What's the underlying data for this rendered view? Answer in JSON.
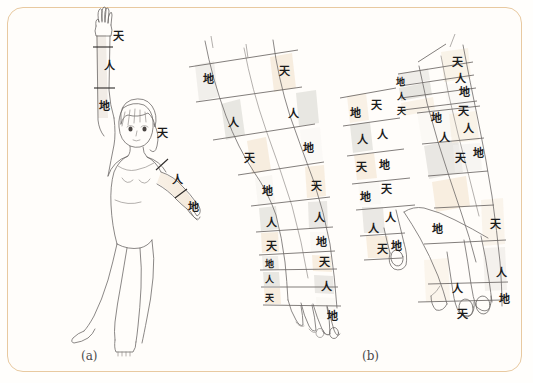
{
  "figure": {
    "panel_a_label": "(a)",
    "panel_b_label": "(b)",
    "glyphs": {
      "tian": "天",
      "ren": "人",
      "di": "地"
    },
    "colors": {
      "border": "#e8c9a0",
      "band_cream": "#f7ece0",
      "band_gray": "#e4e2de",
      "outline": "#6d6a68",
      "text": "#1b1b1b",
      "skin_tint": "#f8efe4"
    }
  },
  "panel_a": {
    "caption": "(a)",
    "raised_arm_labels": [
      {
        "text": "天",
        "x": 113,
        "y": 40
      },
      {
        "text": "人",
        "x": 104,
        "y": 70
      },
      {
        "text": "地",
        "x": 101,
        "y": 107
      }
    ],
    "lowered_arm_labels": [
      {
        "text": "天",
        "x": 159,
        "y": 133
      },
      {
        "text": "人",
        "x": 175,
        "y": 180
      },
      {
        "text": "地",
        "x": 191,
        "y": 208
      }
    ]
  },
  "panel_b": {
    "caption": "(b)",
    "arm_front": {
      "left_column_labels": [
        {
          "text": "地",
          "x": 207,
          "y": 78
        },
        {
          "text": "人",
          "x": 232,
          "y": 122
        },
        {
          "text": "天",
          "x": 248,
          "y": 157
        },
        {
          "text": "地",
          "x": 266,
          "y": 191
        },
        {
          "text": "人",
          "x": 274,
          "y": 229
        },
        {
          "text": "天",
          "x": 277,
          "y": 252
        },
        {
          "text": "地",
          "x": 271,
          "y": 272
        },
        {
          "text": "人",
          "x": 271,
          "y": 285
        },
        {
          "text": "天",
          "x": 271,
          "y": 303
        }
      ],
      "right_column_labels": [
        {
          "text": "天",
          "x": 283,
          "y": 70
        },
        {
          "text": "人",
          "x": 291,
          "y": 113
        },
        {
          "text": "地",
          "x": 307,
          "y": 147
        },
        {
          "text": "天",
          "x": 315,
          "y": 185
        },
        {
          "text": "人",
          "x": 318,
          "y": 218
        },
        {
          "text": "地",
          "x": 319,
          "y": 242
        },
        {
          "text": "天",
          "x": 323,
          "y": 263
        },
        {
          "text": "人",
          "x": 325,
          "y": 288
        },
        {
          "text": "地",
          "x": 331,
          "y": 317
        }
      ]
    },
    "arm_back": {
      "thumb_labels": [
        {
          "text": "地",
          "x": 354,
          "y": 112
        },
        {
          "text": "天",
          "x": 375,
          "y": 104
        },
        {
          "text": "人",
          "x": 361,
          "y": 139
        },
        {
          "text": "人",
          "x": 381,
          "y": 134
        },
        {
          "text": "天",
          "x": 360,
          "y": 166
        },
        {
          "text": "地",
          "x": 383,
          "y": 164
        },
        {
          "text": "地",
          "x": 364,
          "y": 196
        },
        {
          "text": "天",
          "x": 385,
          "y": 188
        },
        {
          "text": "人",
          "x": 389,
          "y": 217
        },
        {
          "text": "人",
          "x": 372,
          "y": 228
        },
        {
          "text": "天",
          "x": 381,
          "y": 248
        },
        {
          "text": "地",
          "x": 403,
          "y": 245
        }
      ],
      "forearm_left_labels": [
        {
          "text": "地",
          "x": 402,
          "y": 81
        },
        {
          "text": "人",
          "x": 404,
          "y": 96
        },
        {
          "text": "天",
          "x": 404,
          "y": 110
        },
        {
          "text": "地",
          "x": 435,
          "y": 117
        },
        {
          "text": "人",
          "x": 443,
          "y": 137
        },
        {
          "text": "天",
          "x": 459,
          "y": 157
        }
      ],
      "forearm_right_labels": [
        {
          "text": "天",
          "x": 456,
          "y": 61
        },
        {
          "text": "人",
          "x": 459,
          "y": 78
        },
        {
          "text": "地",
          "x": 463,
          "y": 91
        },
        {
          "text": "天",
          "x": 462,
          "y": 110
        },
        {
          "text": "人",
          "x": 467,
          "y": 128
        },
        {
          "text": "地",
          "x": 477,
          "y": 152
        }
      ],
      "hand_labels": [
        {
          "text": "地",
          "x": 436,
          "y": 228
        },
        {
          "text": "天",
          "x": 494,
          "y": 223
        },
        {
          "text": "人",
          "x": 500,
          "y": 272
        },
        {
          "text": "人",
          "x": 456,
          "y": 288
        },
        {
          "text": "地",
          "x": 503,
          "y": 298
        },
        {
          "text": "天",
          "x": 461,
          "y": 313
        }
      ]
    }
  }
}
